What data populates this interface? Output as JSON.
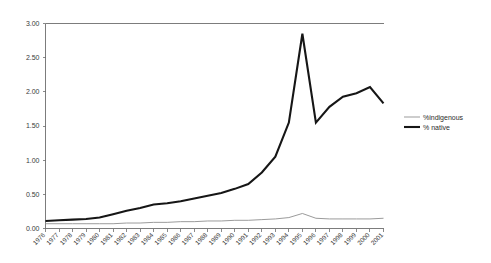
{
  "chart_data": {
    "type": "line",
    "title": "",
    "subtitle": "",
    "xlabel": "",
    "ylabel": "",
    "grid": false,
    "legend_position": "right",
    "ylim": [
      0,
      3.0
    ],
    "ytick_labels": [
      "0.00",
      "0.50",
      "1.00",
      "1.50",
      "2.00",
      "2.50",
      "3.00"
    ],
    "ytick_values": [
      0,
      0.5,
      1.0,
      1.5,
      2.0,
      2.5,
      3.0
    ],
    "categories": [
      "1976",
      "1977",
      "1978",
      "1979",
      "1980",
      "1981",
      "1982",
      "1983",
      "1984",
      "1985",
      "1986",
      "1987",
      "1988",
      "1989",
      "1990",
      "1991",
      "1992",
      "1993",
      "1994",
      "1995",
      "1996",
      "1997",
      "1998",
      "1999",
      "2000",
      "2001"
    ],
    "series": [
      {
        "name": "%indigenous",
        "color": "#9b9b9b",
        "width": 1.0,
        "values": [
          0.07,
          0.07,
          0.07,
          0.07,
          0.07,
          0.07,
          0.08,
          0.08,
          0.09,
          0.09,
          0.1,
          0.1,
          0.11,
          0.11,
          0.12,
          0.12,
          0.13,
          0.14,
          0.16,
          0.22,
          0.15,
          0.14,
          0.14,
          0.14,
          0.14,
          0.15
        ]
      },
      {
        "name": "% native",
        "color": "#161616",
        "width": 2.1,
        "values": [
          0.11,
          0.12,
          0.13,
          0.14,
          0.16,
          0.21,
          0.26,
          0.3,
          0.35,
          0.37,
          0.4,
          0.44,
          0.48,
          0.52,
          0.58,
          0.65,
          0.82,
          1.05,
          1.55,
          2.85,
          1.55,
          1.78,
          1.93,
          1.98,
          2.07,
          1.83
        ]
      }
    ],
    "legend": [
      {
        "label": "%indigenous",
        "color": "#9b9b9b",
        "width": 1.0
      },
      {
        "label": "% native",
        "color": "#161616",
        "width": 2.1
      }
    ]
  }
}
